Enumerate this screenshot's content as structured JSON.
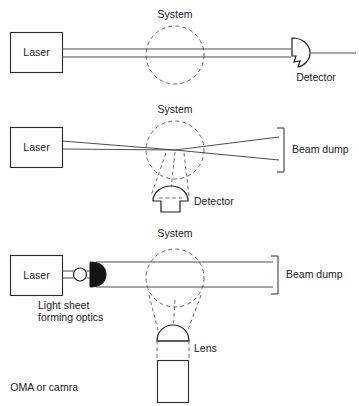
{
  "figure": {
    "background_color": "#ffffff",
    "line_color": "#2a2a2a",
    "dashed_color": "#555555"
  },
  "panels": [
    {
      "id": "panel-transmission",
      "name": "line-of-sight-transmission",
      "source_label": "Laser",
      "region_label": "System",
      "detector_label": "Detector",
      "beam_type": "collimated",
      "detector_shape": "notched-photodiode"
    },
    {
      "id": "panel-focused-scattering",
      "name": "focused-beam-scattering",
      "source_label": "Laser",
      "region_label": "System",
      "detector_label": "Detector",
      "terminator_label": "Beam dump",
      "beam_type": "focused",
      "detector_shape": "dome-pmt"
    },
    {
      "id": "panel-light-sheet",
      "name": "light-sheet-imaging",
      "source_label": "Laser",
      "region_label": "System",
      "optics_label": "Light sheet\nforming optics",
      "optics_label_line1": "Light sheet",
      "optics_label_line2": "forming optics",
      "terminator_label": "Beam dump",
      "lens_label": "Lens",
      "camera_label": "OMA or camra",
      "beam_type": "sheet",
      "detector_shape": "lens-and-array-camera"
    }
  ]
}
